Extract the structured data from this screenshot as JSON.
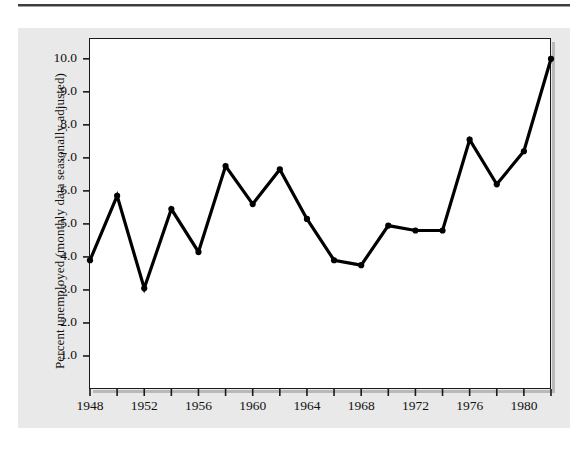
{
  "figure": {
    "background_color": "#e9e9e9",
    "plot_background_color": "#ffffff",
    "line_color": "#000000",
    "rule_color": "#2a2a2a"
  },
  "chart_data": {
    "type": "line",
    "title": "",
    "xlabel": "",
    "ylabel": "Percent unemployed (monthly data seasonally adjusted)",
    "xlim": [
      1948,
      1982
    ],
    "ylim": [
      0,
      10.6
    ],
    "grid": false,
    "legend": null,
    "x": [
      1948,
      1950,
      1952,
      1954,
      1956,
      1958,
      1960,
      1962,
      1964,
      1966,
      1968,
      1970,
      1972,
      1974,
      1976,
      1978,
      1980,
      1982
    ],
    "values": [
      3.9,
      5.85,
      3.05,
      5.45,
      4.15,
      6.75,
      5.6,
      6.65,
      5.15,
      3.9,
      3.75,
      4.95,
      4.8,
      4.8,
      7.55,
      6.2,
      7.2,
      10.0
    ],
    "series": [
      {
        "name": "Percent unemployed",
        "values": [
          3.9,
          5.85,
          3.05,
          5.45,
          4.15,
          6.75,
          5.6,
          6.65,
          5.15,
          3.9,
          3.75,
          4.95,
          4.8,
          4.8,
          7.55,
          6.2,
          7.2,
          10.0
        ]
      }
    ],
    "y_tick_labels": [
      "1.0",
      "2.0",
      "3.0",
      "4.0",
      "5.0",
      "6.0",
      "7.0",
      "8.0",
      "9.0",
      "10.0"
    ],
    "y_tick_values": [
      1.0,
      2.0,
      3.0,
      4.0,
      5.0,
      6.0,
      7.0,
      8.0,
      9.0,
      10.0
    ],
    "x_tick_labels": [
      "1948",
      "1952",
      "1956",
      "1960",
      "1964",
      "1968",
      "1972",
      "1976",
      "1980"
    ],
    "x_tick_values": [
      1948,
      1952,
      1956,
      1960,
      1964,
      1968,
      1972,
      1976,
      1980
    ],
    "x_minor_tick_values": [
      1948,
      1950,
      1952,
      1954,
      1956,
      1958,
      1960,
      1962,
      1964,
      1966,
      1968,
      1970,
      1972,
      1974,
      1976,
      1978,
      1980,
      1982
    ]
  }
}
